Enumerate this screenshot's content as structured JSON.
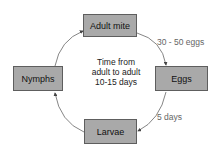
{
  "diagram": {
    "type": "life-cycle",
    "stages": [
      {
        "id": "adult",
        "label": "Adult mite"
      },
      {
        "id": "eggs",
        "label": "Eggs"
      },
      {
        "id": "larvae",
        "label": "Larvae"
      },
      {
        "id": "nymphs",
        "label": "Nymphs"
      }
    ],
    "edges": [
      {
        "from": "adult",
        "to": "eggs",
        "label": "30 - 50 eggs"
      },
      {
        "from": "eggs",
        "to": "larvae",
        "label": "5 days"
      },
      {
        "from": "larvae",
        "to": "nymphs",
        "label": ""
      },
      {
        "from": "nymphs",
        "to": "adult",
        "label": ""
      }
    ],
    "center_text": [
      "Time from",
      "adult to adult",
      "10-15 days"
    ],
    "colors": {
      "box_fill": "#a9a9a9",
      "box_border": "#5e5e5e",
      "arrow": "#555555"
    }
  }
}
